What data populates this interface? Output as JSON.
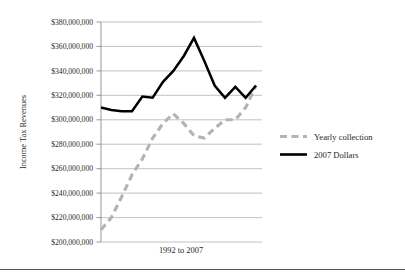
{
  "figure": {
    "background_color": "#ffffff",
    "has_bottom_rule": true
  },
  "axes": {
    "y_title": "Income Tax Revenues",
    "x_title": "1992 to 2007",
    "y_tick_labels": [
      "$380,000,000",
      "$360,000,000",
      "$340,000,000",
      "$320,000,000",
      "$300,000,000",
      "$280,000,000",
      "$260,000,000",
      "$240,000,000",
      "$220,000,000",
      "$200,000,000"
    ]
  },
  "legend": {
    "position": "right",
    "entries": [
      {
        "label": "Yearly collection",
        "style": "dashed",
        "color": "#b3b3b3"
      },
      {
        "label": "2007 Dollars",
        "style": "solid",
        "color": "#000000"
      }
    ]
  },
  "chart_data": {
    "type": "line",
    "title": "",
    "subtitle": "",
    "xlabel": "1992 to 2007",
    "ylabel": "Income Tax Revenues",
    "ylim": [
      200000000,
      380000000
    ],
    "ytick_values": [
      380000000,
      360000000,
      340000000,
      320000000,
      300000000,
      280000000,
      260000000,
      240000000,
      220000000,
      200000000
    ],
    "ytick_labels": [
      "$380,000,000",
      "$360,000,000",
      "$340,000,000",
      "$320,000,000",
      "$300,000,000",
      "$280,000,000",
      "$260,000,000",
      "$240,000,000",
      "$220,000,000",
      "$200,000,000"
    ],
    "grid": true,
    "grid_axis": "y",
    "legend_position": "right",
    "x": [
      1992,
      1993,
      1994,
      1995,
      1996,
      1997,
      1998,
      1999,
      2000,
      2001,
      2002,
      2003,
      2004,
      2005,
      2006,
      2007
    ],
    "categories": [
      "1992",
      "1993",
      "1994",
      "1995",
      "1996",
      "1997",
      "1998",
      "1999",
      "2000",
      "2001",
      "2002",
      "2003",
      "2004",
      "2005",
      "2006",
      "2007"
    ],
    "x_tick_labels_shown": false,
    "series": [
      {
        "name": "Yearly collection",
        "style": "dashed",
        "color": "#b3b3b3",
        "values": [
          210000000,
          220000000,
          237000000,
          255000000,
          268000000,
          285000000,
          297000000,
          305000000,
          297000000,
          287000000,
          285000000,
          293000000,
          300000000,
          300000000,
          310000000,
          328000000
        ]
      },
      {
        "name": "2007 Dollars",
        "style": "solid",
        "color": "#000000",
        "values": [
          310000000,
          308000000,
          307000000,
          307000000,
          319000000,
          318000000,
          331000000,
          340000000,
          352000000,
          367000000,
          348000000,
          328000000,
          318000000,
          327000000,
          318000000,
          328000000
        ]
      }
    ],
    "annotations": []
  }
}
